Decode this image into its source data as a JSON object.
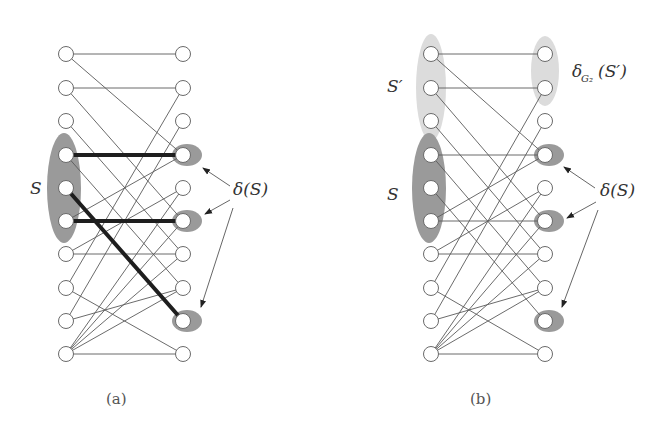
{
  "figure": {
    "panels": [
      {
        "id": "a",
        "caption": "(a)",
        "left_x": 66,
        "right_x": 183,
        "set_label": "S",
        "boundary_label": "δ(S)",
        "thick_edges": [
          [
            4,
            4
          ],
          [
            5,
            9
          ],
          [
            6,
            6
          ]
        ],
        "highlight_right": [
          4,
          6,
          9
        ],
        "set_nodes": [
          4,
          5,
          6
        ],
        "secondary_label": "",
        "secondary_label_sub": "",
        "secondary_set_label": ""
      },
      {
        "id": "b",
        "caption": "(b)",
        "left_x": 431,
        "right_x": 545,
        "set_label": "S",
        "boundary_label": "δ(S)",
        "thick_edges": [],
        "highlight_right": [
          4,
          6,
          9
        ],
        "set_nodes": [
          4,
          5,
          6
        ],
        "secondary_set_label": "S′",
        "secondary_set_nodes": [
          1,
          2,
          3
        ],
        "secondary_right_nodes": [
          1,
          2
        ],
        "secondary_label": "δ",
        "secondary_label_sub": "G₂",
        "secondary_label_arg": "(S′)"
      }
    ],
    "rows_y": [
      54,
      88,
      121,
      155,
      188,
      221,
      254,
      288,
      321,
      354
    ],
    "edges": [
      [
        1,
        1
      ],
      [
        1,
        4
      ],
      [
        2,
        2
      ],
      [
        2,
        6
      ],
      [
        3,
        7
      ],
      [
        4,
        4
      ],
      [
        4,
        8
      ],
      [
        5,
        9
      ],
      [
        6,
        6
      ],
      [
        6,
        4
      ],
      [
        7,
        7
      ],
      [
        7,
        5
      ],
      [
        8,
        10
      ],
      [
        8,
        2
      ],
      [
        9,
        8
      ],
      [
        9,
        3
      ],
      [
        10,
        10
      ],
      [
        10,
        8
      ],
      [
        10,
        7
      ],
      [
        10,
        6
      ],
      [
        10,
        5
      ]
    ],
    "colors": {
      "set_fill": "#9a9a9a",
      "secondary_fill": "#dcdcdc",
      "highlight_fill": "#9a9a9a",
      "edge": "#5a5a5a",
      "thick_edge": "#1e1e1e"
    }
  }
}
